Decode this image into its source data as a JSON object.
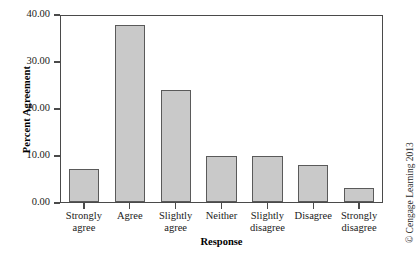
{
  "chart_data": {
    "type": "bar",
    "title": "",
    "xlabel": "Response",
    "ylabel": "Percent Agreement",
    "categories": [
      "Strongly\nagree",
      "Agree",
      "Slightly\nagree",
      "Neither",
      "Slightly\ndisagree",
      "Disagree",
      "Strongly\ndisagree"
    ],
    "category_lines": [
      [
        "Strongly",
        "agree"
      ],
      [
        "Agree",
        ""
      ],
      [
        "Slightly",
        "agree"
      ],
      [
        "Neither",
        ""
      ],
      [
        "Slightly",
        "disagree"
      ],
      [
        "Disagree",
        ""
      ],
      [
        "Strongly",
        "disagree"
      ]
    ],
    "values": [
      7,
      38,
      24,
      10,
      10,
      8,
      3
    ],
    "ylim": [
      0,
      40
    ],
    "ytick_values": [
      0,
      10,
      20,
      30,
      40
    ],
    "ytick_labels": [
      "0.00",
      "10.00",
      "20.00",
      "30.00",
      "40.00"
    ],
    "grid": false,
    "legend": null,
    "bar_fill_color": "#c9c9c9",
    "bar_edge_color": "#5a5a5a",
    "axis_color": "#4a4a4a"
  },
  "credit": {
    "text": "© Cengage Learning 2013"
  }
}
